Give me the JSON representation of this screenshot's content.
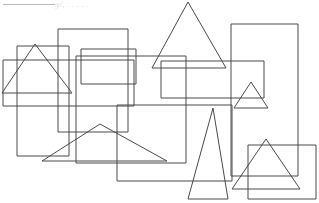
{
  "page": {
    "width": 319,
    "height": 203,
    "background_color": "#ffffff",
    "stroke_color": "#4a4a4a",
    "stroke_width": 1
  },
  "annotations": {
    "header_rule_color": "#b9b9b9",
    "header_scrawl_text": "y/, . . . . .",
    "header_scrawl_color": "#d7d7d7",
    "header_scrawl_note": "faint illegible handwriting at top"
  },
  "chart_data": {
    "type": "scatter",
    "xlabel": "",
    "ylabel": "",
    "xlim": [
      0,
      319
    ],
    "ylim": [
      0,
      203
    ],
    "grid": false,
    "legend": "none",
    "stroke_color": "#4a4a4a",
    "fill": "none",
    "shape_counts": {
      "rectangles": 8,
      "triangles": 6,
      "total": 14
    },
    "shapes": [
      {
        "id": "rect-left-tall",
        "kind": "rectangle",
        "x": 17,
        "y": 46,
        "width": 52,
        "height": 110,
        "points": "17,46 69,46 69,156 17,156"
      },
      {
        "id": "rect-upper-left-tall",
        "kind": "rectangle",
        "x": 58,
        "y": 29,
        "width": 70,
        "height": 103,
        "points": "58,29 128,29 128,132 58,132"
      },
      {
        "id": "rect-wide-center-left",
        "kind": "rectangle",
        "x": 3,
        "y": 60,
        "width": 131,
        "height": 46,
        "points": "3,60 134,60 134,106 3,106"
      },
      {
        "id": "rect-center-small",
        "kind": "rectangle",
        "x": 81,
        "y": 49,
        "width": 55,
        "height": 35,
        "points": "81,49 136,49 136,84 81,84"
      },
      {
        "id": "rect-center-big",
        "kind": "rectangle",
        "x": 76,
        "y": 56,
        "width": 110,
        "height": 107,
        "points": "76,56 186,56 186,163 76,163"
      },
      {
        "id": "rect-upper-right",
        "kind": "rectangle",
        "x": 161,
        "y": 61,
        "width": 103,
        "height": 37,
        "points": "161,61 264,61 264,98 161,98"
      },
      {
        "id": "rect-far-right-tall",
        "kind": "rectangle",
        "x": 231,
        "y": 24,
        "width": 67,
        "height": 152,
        "points": "231,24 298,24 298,176 231,176"
      },
      {
        "id": "rect-center-bottom",
        "kind": "rectangle",
        "x": 117,
        "y": 105,
        "width": 115,
        "height": 76,
        "points": "117,105 232,105 232,181 117,181"
      },
      {
        "id": "rect-bottom-right",
        "kind": "rectangle",
        "x": 248,
        "y": 145,
        "width": 68,
        "height": 54,
        "points": "248,145 316,145 316,199 248,199"
      },
      {
        "id": "triangle-left",
        "kind": "triangle",
        "apex": [
          35,
          44
        ],
        "base_left": [
          2,
          93
        ],
        "base_right": [
          72,
          93
        ],
        "points": "35,44 72,93 2,93"
      },
      {
        "id": "triangle-top-large",
        "kind": "triangle",
        "apex": [
          188,
          2
        ],
        "base_left": [
          152,
          68
        ],
        "base_right": [
          226,
          68
        ],
        "points": "188,2 226,68 152,68"
      },
      {
        "id": "triangle-right-small",
        "kind": "triangle",
        "apex": [
          251,
          82
        ],
        "base_left": [
          234,
          108
        ],
        "base_right": [
          268,
          108
        ],
        "points": "251,82 268,108 234,108"
      },
      {
        "id": "triangle-bottom-wide-flat",
        "kind": "triangle",
        "apex": [
          100,
          124
        ],
        "base_left": [
          42,
          161
        ],
        "base_right": [
          167,
          161
        ],
        "points": "100,124 167,161 42,161"
      },
      {
        "id": "triangle-bottom-narrow-tall",
        "kind": "triangle",
        "apex": [
          213,
          108
        ],
        "base_left": [
          188,
          199
        ],
        "base_right": [
          228,
          199
        ],
        "points": "213,108 228,199 188,199"
      },
      {
        "id": "triangle-bottom-right",
        "kind": "triangle",
        "apex": [
          266,
          139
        ],
        "base_left": [
          232,
          189
        ],
        "base_right": [
          300,
          189
        ],
        "points": "266,139 300,189 232,189"
      }
    ]
  }
}
